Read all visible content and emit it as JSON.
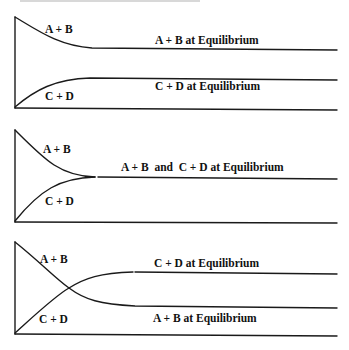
{
  "figure": {
    "colors": {
      "ink": "#1a1a1a",
      "background": "#ffffff"
    },
    "panels": [
      {
        "id": "panel-1",
        "curve_labels": {
          "reactants": "A + B",
          "products": "C + D"
        },
        "equilibrium_labels": {
          "top": "A + B at Equilibrium",
          "bottom": "C + D at Equilibrium"
        }
      },
      {
        "id": "panel-2",
        "curve_labels": {
          "reactants": "A + B",
          "products": "C + D"
        },
        "equilibrium_labels": {
          "combined": "A + B  and  C + D at Equilibrium"
        }
      },
      {
        "id": "panel-3",
        "curve_labels": {
          "reactants": "A + B",
          "products": "C + D"
        },
        "equilibrium_labels": {
          "top": "C + D at Equilibrium",
          "bottom": "A + B at Equilibrium"
        }
      }
    ]
  }
}
